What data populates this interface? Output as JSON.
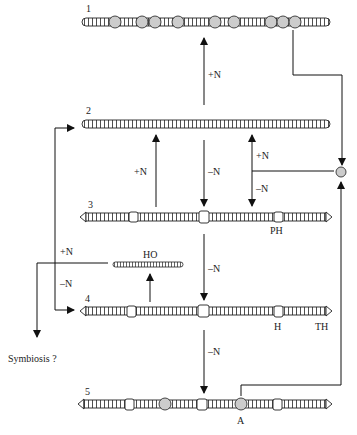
{
  "diagram": {
    "type": "filament-differentiation",
    "filaments": [
      {
        "id": "1",
        "label": "1",
        "y": 22,
        "x1": 80,
        "x2": 330,
        "description": "filament with many akinetes/heterocysts (circles)"
      },
      {
        "id": "2",
        "label": "2",
        "y": 124,
        "x1": 80,
        "x2": 330,
        "description": "undifferentiated vegetative filament"
      },
      {
        "id": "3",
        "label": "3",
        "y": 217,
        "x1": 80,
        "x2": 332,
        "description": "filament with proheterocysts",
        "marker_label": "PH"
      },
      {
        "id": "4",
        "label": "4",
        "y": 311,
        "x1": 80,
        "x2": 332,
        "description": "filament with heterocysts",
        "marker_labels": [
          "H",
          "TH"
        ]
      },
      {
        "id": "5",
        "label": "5",
        "y": 404,
        "x1": 80,
        "x2": 332,
        "description": "filament with akinetes",
        "marker_label": "A"
      },
      {
        "id": "HO",
        "label": "HO",
        "y": 264,
        "description": "hormogonium"
      }
    ],
    "arrow_labels": {
      "plus_n": "+N",
      "minus_n": "–N"
    },
    "labels": {
      "n1": "1",
      "n2": "2",
      "n3": "3",
      "n4": "4",
      "n5": "5",
      "ph": "PH",
      "h": "H",
      "th": "TH",
      "a": "A",
      "ho": "HO",
      "symbiosis": "Symbiosis ?",
      "plus_n_1": "+N",
      "plus_n_2": "+N",
      "plus_n_3": "+N",
      "plus_n_4": "+N",
      "minus_n_1": "–N",
      "minus_n_2": "–N",
      "minus_n_3": "–N",
      "minus_n_4": "–N",
      "minus_n_5": "–N"
    }
  }
}
